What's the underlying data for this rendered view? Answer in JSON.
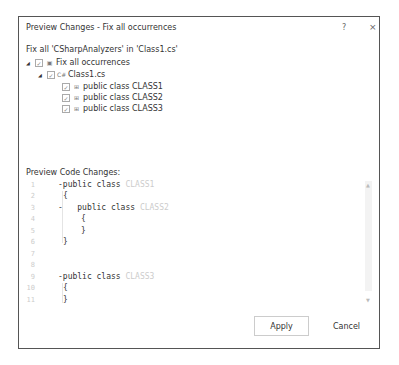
{
  "window": {
    "title": "Preview Changes - Fix all occurrences",
    "help_label": "?",
    "close_label": "×"
  },
  "header": {
    "description": "Fix all 'CSharpAnalyzers' in 'Class1.cs'"
  },
  "tree": {
    "root": {
      "label": "Fix all occurrences",
      "checked": true,
      "expanded": true
    },
    "file": {
      "label": "Class1.cs",
      "checked": true,
      "expanded": true
    },
    "items": [
      {
        "label": "public class CLASS1",
        "checked": true
      },
      {
        "label": "public class CLASS2",
        "checked": true
      },
      {
        "label": "public class CLASS3",
        "checked": true
      }
    ]
  },
  "preview": {
    "label": "Preview Code Changes:",
    "lines": [
      {
        "num": "1",
        "kw": "public class ",
        "id": "CLASS1",
        "indent": 0,
        "fold": true
      },
      {
        "num": "2",
        "kw": "{",
        "id": "",
        "indent": 0
      },
      {
        "num": "3",
        "kw": "public class ",
        "id": "CLASS2",
        "indent": 1,
        "fold": true
      },
      {
        "num": "4",
        "kw": "{",
        "id": "",
        "indent": 1
      },
      {
        "num": "5",
        "kw": "}",
        "id": "",
        "indent": 1
      },
      {
        "num": "6",
        "kw": "}",
        "id": "",
        "indent": 0
      },
      {
        "num": "7",
        "kw": "",
        "id": "",
        "indent": 0
      },
      {
        "num": "8",
        "kw": "",
        "id": "",
        "indent": 0
      },
      {
        "num": "9",
        "kw": "public class ",
        "id": "CLASS3",
        "indent": 0,
        "fold": true
      },
      {
        "num": "10",
        "kw": "{",
        "id": "",
        "indent": 0
      },
      {
        "num": "11",
        "kw": "}",
        "id": "",
        "indent": 0
      }
    ]
  },
  "buttons": {
    "apply": "Apply",
    "cancel": "Cancel"
  }
}
